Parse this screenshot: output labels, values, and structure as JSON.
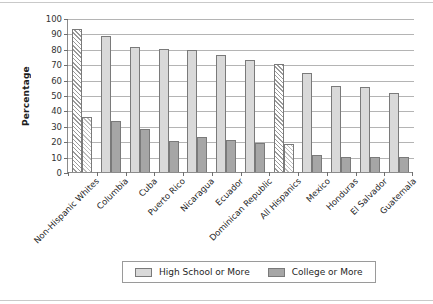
{
  "chart_data": {
    "type": "bar",
    "title": "",
    "xlabel": "",
    "ylabel": "Percentage",
    "ylim": [
      0,
      100
    ],
    "ytick_step": 10,
    "yticks": [
      100,
      90,
      80,
      70,
      60,
      50,
      40,
      30,
      20,
      10,
      0
    ],
    "grid": true,
    "legend_position": "bottom-center",
    "categories": [
      "Non-Hispanic Whites",
      "Columbia",
      "Cuba",
      "Puerto Rico",
      "Nicaragua",
      "Ecuador",
      "Dominican Republic",
      "All Hispanics",
      "Mexico",
      "Honduras",
      "El Salvador",
      "Guatemala"
    ],
    "highlighted_categories": [
      "Non-Hispanic Whites",
      "All Hispanics"
    ],
    "series": [
      {
        "name": "High School or More",
        "color": "#d9d9d9",
        "values": [
          93,
          88,
          81,
          80,
          79,
          76,
          73,
          70,
          64,
          56,
          55,
          51
        ]
      },
      {
        "name": "College or More",
        "color": "#a6a6a6",
        "values": [
          36,
          33,
          28,
          20,
          23,
          21,
          19,
          18,
          11,
          10,
          10,
          10
        ]
      }
    ]
  },
  "legend": {
    "entries": [
      {
        "label": "High School or More",
        "swatch": "hs"
      },
      {
        "label": "College or More",
        "swatch": "col"
      }
    ]
  }
}
